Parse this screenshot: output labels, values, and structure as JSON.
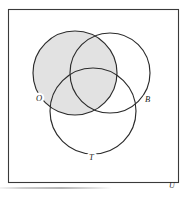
{
  "figure": {
    "kind": "venn-diagram",
    "sets_count": 3,
    "background_color": "#ffffff",
    "stroke_color": "#2b2b2b",
    "shade_color": "#e2e2e2",
    "universe": {
      "label": "U",
      "rect": {
        "x": 8,
        "y": 9,
        "width": 170,
        "height": 173
      },
      "label_position": {
        "x": 169,
        "y": 188
      },
      "border_color": "#3a3a3a"
    },
    "circles": [
      {
        "id": "O",
        "label": "O",
        "cx": 75,
        "cy": 73,
        "r": 42,
        "shaded": true,
        "fill": "#e2e2e2",
        "label_position": {
          "x": 36,
          "y": 101
        }
      },
      {
        "id": "B",
        "label": "B",
        "cx": 110,
        "cy": 73,
        "r": 40,
        "shaded": false,
        "fill": "#ffffff",
        "label_position": {
          "x": 145,
          "y": 102
        }
      },
      {
        "id": "T",
        "label": "T",
        "cx": 93,
        "cy": 111,
        "r": 43,
        "shaded": false,
        "fill": "#ffffff",
        "label_position": {
          "x": 89,
          "y": 160
        }
      }
    ],
    "shaded_region_description": "O",
    "caption": ""
  }
}
